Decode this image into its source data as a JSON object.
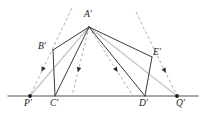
{
  "figure": {
    "kind": "geometry-diagram",
    "width": 206,
    "height": 124,
    "background": "#ffffff",
    "colors": {
      "baseline": "#8a8a8a",
      "solid_stroke": "#3a3a3a",
      "light_stroke": "#c9c9c9",
      "dashed_stroke": "#9a9a9a",
      "label_text": "#1a1a1a",
      "point_dot": "#1a1a1a"
    },
    "baseline": {
      "name": "horizontal-baseline",
      "x1": 8,
      "y1": 96,
      "x2": 198,
      "y2": 96
    },
    "points": [
      {
        "id": "A",
        "label": "A′",
        "x": 89,
        "y": 27,
        "label_x": 84,
        "label_y": 10,
        "dot": false
      },
      {
        "id": "B",
        "label": "B′",
        "x": 53,
        "y": 50,
        "label_x": 38,
        "label_y": 42,
        "dot": false
      },
      {
        "id": "E",
        "label": "E′",
        "x": 152,
        "y": 57,
        "label_x": 153,
        "label_y": 48,
        "dot": false
      },
      {
        "id": "P",
        "label": "P′",
        "x": 30,
        "y": 96,
        "label_x": 24,
        "label_y": 99,
        "dot": true
      },
      {
        "id": "C",
        "label": "C′",
        "x": 55,
        "y": 96,
        "label_x": 50,
        "label_y": 99,
        "dot": false
      },
      {
        "id": "D",
        "label": "D′",
        "x": 145,
        "y": 96,
        "label_x": 139,
        "label_y": 99,
        "dot": false
      },
      {
        "id": "Q",
        "label": "Q′",
        "x": 177,
        "y": 96,
        "label_x": 176,
        "label_y": 99,
        "dot": true
      }
    ],
    "solid_segments": [
      {
        "name": "segment-A-B",
        "x1": 89,
        "y1": 27,
        "x2": 53,
        "y2": 50
      },
      {
        "name": "segment-B-C",
        "x1": 53,
        "y1": 50,
        "x2": 55,
        "y2": 96
      },
      {
        "name": "segment-A-C",
        "x1": 89,
        "y1": 27,
        "x2": 55,
        "y2": 96
      },
      {
        "name": "segment-A-E",
        "x1": 89,
        "y1": 27,
        "x2": 152,
        "y2": 57
      },
      {
        "name": "segment-E-D",
        "x1": 152,
        "y1": 57,
        "x2": 145,
        "y2": 96
      },
      {
        "name": "segment-A-D",
        "x1": 89,
        "y1": 27,
        "x2": 145,
        "y2": 96
      }
    ],
    "light_segments": [
      {
        "name": "segment-A-P-light",
        "x1": 89,
        "y1": 27,
        "x2": 30,
        "y2": 96
      },
      {
        "name": "segment-A-Q-light",
        "x1": 89,
        "y1": 27,
        "x2": 177,
        "y2": 96
      }
    ],
    "dashed_rays": [
      {
        "name": "dashed-ray-through-B",
        "x1": 72,
        "y1": 8,
        "x2": 30,
        "y2": 96,
        "arrow_t": 0.7
      },
      {
        "name": "dashed-ray-A-to-C",
        "x1": 89,
        "y1": 27,
        "x2": 72,
        "y2": 96,
        "arrow_t": 0.62
      },
      {
        "name": "dashed-ray-A-to-D",
        "x1": 89,
        "y1": 27,
        "x2": 133,
        "y2": 96,
        "arrow_t": 0.62
      },
      {
        "name": "dashed-ray-through-E",
        "x1": 136,
        "y1": 12,
        "x2": 177,
        "y2": 96,
        "arrow_t": 0.7
      }
    ]
  }
}
